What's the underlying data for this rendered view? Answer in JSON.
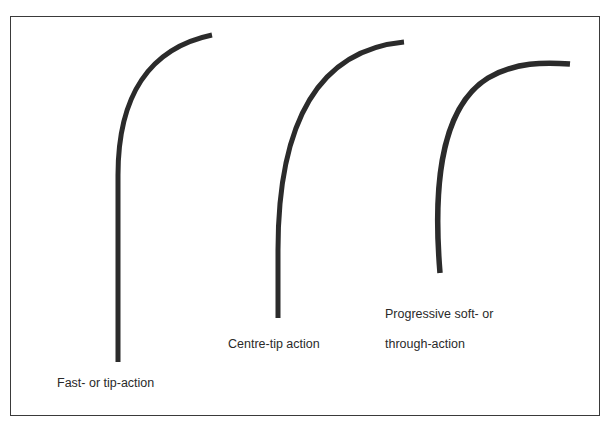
{
  "diagram": {
    "stroke_color": "#2b2b2b",
    "labels": {
      "fast": "Fast- or tip-action",
      "centre": "Centre-tip action",
      "progressive_line1": "Progressive soft- or",
      "progressive_line2": "through-action"
    },
    "curves": [
      {
        "name": "Fast- or tip-action",
        "base": [
          118,
          362
        ],
        "tip": [
          212,
          35
        ]
      },
      {
        "name": "Centre-tip action",
        "base": [
          278,
          318
        ],
        "tip": [
          404,
          42
        ]
      },
      {
        "name": "Progressive soft- or through-action",
        "base": [
          440,
          273
        ],
        "tip": [
          570,
          63
        ]
      }
    ]
  }
}
